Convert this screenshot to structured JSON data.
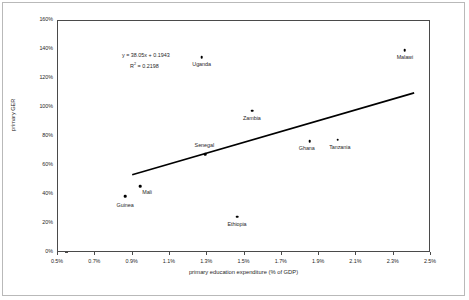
{
  "chart_data": {
    "type": "scatter",
    "title": "",
    "xlabel": "primary education expenditure (% of GDP)",
    "ylabel": "primary GER",
    "xlim": [
      0.5,
      2.5
    ],
    "ylim": [
      0.0,
      1.6
    ],
    "xticks": [
      "0.5%",
      "0.7%",
      "0.9%",
      "1.1%",
      "1.3%",
      "1.5%",
      "1.7%",
      "1.9%",
      "2.1%",
      "2.3%",
      "2.5%"
    ],
    "xtick_values": [
      0.5,
      0.7,
      0.9,
      1.1,
      1.3,
      1.5,
      1.7,
      1.9,
      2.1,
      2.3,
      2.5
    ],
    "yticks": [
      "0%",
      "20%",
      "40%",
      "60%",
      "80%",
      "100%",
      "120%",
      "140%",
      "160%"
    ],
    "ytick_values": [
      0,
      20,
      40,
      60,
      80,
      100,
      120,
      140,
      160
    ],
    "grid": false,
    "legend": "none",
    "points": [
      {
        "label": "Guinea",
        "x": 0.86,
        "y": 39,
        "label_dx": 0,
        "label_dy": 7
      },
      {
        "label": "Mali",
        "x": 0.94,
        "y": 46,
        "label_dx": 7,
        "label_dy": 4
      },
      {
        "label": "Uganda",
        "x": 1.27,
        "y": 135,
        "label_dx": 0,
        "label_dy": 5
      },
      {
        "label": "Senegal",
        "x": 1.29,
        "y": 68,
        "label_dx": -1,
        "label_dy": -11
      },
      {
        "label": "Ethiopia",
        "x": 1.46,
        "y": 25,
        "label_dx": 0,
        "label_dy": 5
      },
      {
        "label": "Zambia",
        "x": 1.54,
        "y": 98,
        "label_dx": 0,
        "label_dy": 5
      },
      {
        "label": "Ghana",
        "x": 1.85,
        "y": 77,
        "label_dx": -3,
        "label_dy": 5
      },
      {
        "label": "Tanzania",
        "x": 2.0,
        "y": 78,
        "label_dx": 2,
        "label_dy": 5
      },
      {
        "label": "Malawi",
        "x": 2.36,
        "y": 140,
        "label_dx": 0,
        "label_dy": 5
      }
    ],
    "trendline": {
      "equation": "y = 38.05x + 0.1943",
      "r_squared_label": "R",
      "r_squared_sup": "2",
      "r_squared_value": " = 0.2198",
      "slope": 38.05,
      "intercept": 0.1943,
      "x_start": 0.9,
      "y_start": 53,
      "x_end": 2.42,
      "y_end": 110
    },
    "marker_color": "#000000",
    "trendline_color": "#000000",
    "axis_color": "#4a4a4a"
  }
}
